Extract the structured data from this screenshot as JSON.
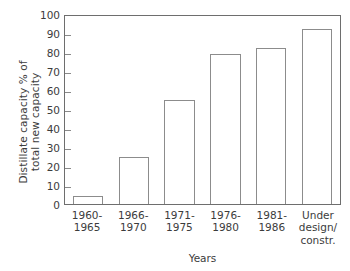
{
  "chart_data": {
    "type": "bar",
    "title": "",
    "subtitle": "",
    "xlabel": "Years",
    "ylabel": "Distillate capacity % of total new capacity",
    "ylabel_lines": [
      "Distillate capacity % of",
      "total new capacity"
    ],
    "categories": [
      "1960-\n1965",
      "1966-\n1970",
      "1971-\n1975",
      "1976-\n1980",
      "1981-\n1986",
      "Under\ndesign/\nconstr."
    ],
    "category_lines": [
      [
        "1960-",
        "1965"
      ],
      [
        "1966-",
        "1970"
      ],
      [
        "1971-",
        "1975"
      ],
      [
        "1976-",
        "1980"
      ],
      [
        "1981-",
        "1986"
      ],
      [
        "Under",
        "design/",
        "constr."
      ]
    ],
    "values": [
      4,
      25,
      55,
      79,
      82,
      92
    ],
    "ylim": [
      0,
      100
    ],
    "ytick_values": [
      0,
      10,
      20,
      30,
      40,
      50,
      60,
      70,
      80,
      90,
      100
    ],
    "ytick_labels": [
      "0",
      "10",
      "20",
      "30",
      "40",
      "50",
      "60",
      "70",
      "80",
      "90",
      "100"
    ],
    "grid": false,
    "legend": null,
    "legend_position": "none",
    "bar_fill_color": "#ffffff",
    "bar_edge_color": "#8c8c8c",
    "axis_color": "#6e6e6e",
    "text_color": "#3c3c3c"
  }
}
